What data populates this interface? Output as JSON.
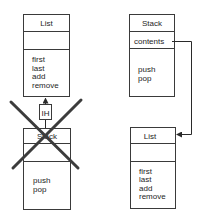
{
  "diagram": {
    "left": {
      "parent_class": {
        "name": "List",
        "fields": [],
        "methods": [
          "first",
          "last",
          "add",
          "remove"
        ]
      },
      "relationship": {
        "type": "inheritance",
        "label": "IH",
        "crossed_out": true
      },
      "child_class": {
        "name": "Stack",
        "fields": [],
        "methods": [
          "push",
          "pop"
        ]
      }
    },
    "right": {
      "container_class": {
        "name": "Stack",
        "fields": [
          "contents"
        ],
        "methods": [
          "push",
          "pop"
        ]
      },
      "relationship": {
        "type": "composition",
        "from": "contents",
        "to": "List"
      },
      "contained_class": {
        "name": "List",
        "fields": [],
        "methods": [
          "first",
          "last",
          "add",
          "remove"
        ]
      }
    },
    "colors": {
      "line": "#3a3a3a",
      "cross": "#3c3c3c",
      "text": "#1e1e1e",
      "background": "#ffffff"
    }
  }
}
